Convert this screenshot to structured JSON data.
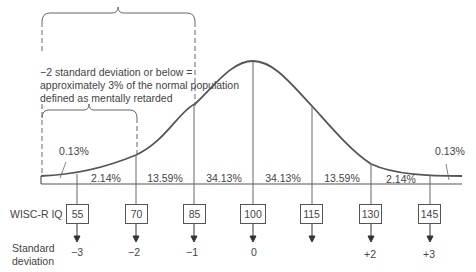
{
  "figure": {
    "note_lines": [
      "−2 standard deviation or below =",
      "approximately 3% of the normal population",
      "defined as mentally retarded"
    ],
    "row_labels": {
      "iq": "WISC-R IQ",
      "sd_line1": "Standard",
      "sd_line2": "deviation"
    },
    "tail_labels": {
      "left": "0.13%",
      "right": "0.13%"
    },
    "segment_percentages": [
      "2.14%",
      "13.59%",
      "34.13%",
      "34.13%",
      "13.59%",
      "2.14%"
    ],
    "iq_scores": [
      "55",
      "70",
      "85",
      "100",
      "115",
      "130",
      "145"
    ],
    "sd_labels": [
      "−3",
      "−2",
      "−1",
      "0",
      "",
      "+2",
      "+3"
    ],
    "colors": {
      "line": "#555555",
      "text": "#444444",
      "background": "#ffffff"
    }
  }
}
